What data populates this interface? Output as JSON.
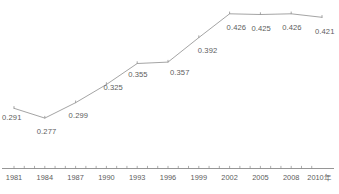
{
  "chart_data": {
    "type": "line",
    "title": "",
    "subtitle": "",
    "xlabel": "",
    "ylabel": "",
    "x_unit_suffix": "年",
    "categories": [
      "1981",
      "1984",
      "1987",
      "1990",
      "1993",
      "1996",
      "1999",
      "2002",
      "2005",
      "2008",
      "2010"
    ],
    "values": [
      0.291,
      0.277,
      0.299,
      0.325,
      0.355,
      0.357,
      0.392,
      0.426,
      0.425,
      0.426,
      0.421
    ],
    "point_labels": [
      "0.291",
      "0.277",
      "0.299",
      "0.325",
      "0.355",
      "0.357",
      "0.392",
      "0.426",
      "0.425",
      "0.426",
      "0.421"
    ],
    "xlim": [
      1980,
      2011
    ],
    "ylim": [
      0.26,
      0.44
    ],
    "grid": false,
    "legend": false,
    "legend_position": "none",
    "series": [
      {
        "name": "series-1",
        "values": [
          0.291,
          0.277,
          0.299,
          0.325,
          0.355,
          0.357,
          0.392,
          0.426,
          0.425,
          0.426,
          0.421
        ]
      }
    ],
    "axis": {
      "x_tick_labels": [
        "1981",
        "1984",
        "1987",
        "1990",
        "1993",
        "1996",
        "1999",
        "2002",
        "2005",
        "2008",
        "2010年"
      ],
      "x_axis_line": true,
      "y_axis_line": false,
      "tick_interval_years": 1,
      "label_interval_years": 3
    },
    "colors": {
      "line": "#9a9a9a",
      "marker": "#8f8f8f",
      "axis": "#8a8a8a",
      "text": "#5d5d5d",
      "background": "#ffffff",
      "caption": "#ededed"
    }
  },
  "caption": {
    "text": ""
  }
}
